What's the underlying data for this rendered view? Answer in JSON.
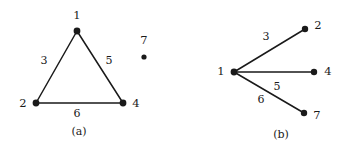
{
  "figure": {
    "background_color": "#ffffff",
    "ink_color": "#1a1a1a",
    "width": 350,
    "height": 150
  },
  "panels": [
    {
      "id": "a",
      "caption": "(a)",
      "caption_pos": {
        "x": 79,
        "y": 131
      },
      "vertices": [
        {
          "id": "v1",
          "label": "1",
          "x": 77,
          "y": 31,
          "label_x": 77,
          "label_y": 16,
          "r": 3.4
        },
        {
          "id": "v2",
          "label": "2",
          "x": 36,
          "y": 103,
          "label_x": 23,
          "label_y": 104,
          "r": 3.4
        },
        {
          "id": "v4",
          "label": "4",
          "x": 123,
          "y": 103,
          "label_x": 136,
          "label_y": 104,
          "r": 3.4
        },
        {
          "id": "v7",
          "label": "7",
          "x": 144,
          "y": 57,
          "label_x": 144,
          "label_y": 41,
          "r": 2.6
        }
      ],
      "edges": [
        {
          "id": "e3",
          "label": "3",
          "from": "v2",
          "to": "v1",
          "x1": 36,
          "y1": 103,
          "x2": 77,
          "y2": 31,
          "label_x": 44,
          "label_y": 60
        },
        {
          "id": "e5",
          "label": "5",
          "from": "v1",
          "to": "v4",
          "x1": 77,
          "y1": 31,
          "x2": 123,
          "y2": 103,
          "label_x": 109,
          "label_y": 60
        },
        {
          "id": "e6",
          "label": "6",
          "from": "v2",
          "to": "v4",
          "x1": 36,
          "y1": 103,
          "x2": 123,
          "y2": 103,
          "label_x": 77,
          "label_y": 113
        }
      ]
    },
    {
      "id": "b",
      "caption": "(b)",
      "caption_pos": {
        "x": 281,
        "y": 134
      },
      "vertices": [
        {
          "id": "v1",
          "label": "1",
          "x": 234,
          "y": 72,
          "label_x": 221,
          "label_y": 72,
          "r": 3.4
        },
        {
          "id": "v2",
          "label": "2",
          "x": 305,
          "y": 29,
          "label_x": 318,
          "label_y": 26,
          "r": 3.2
        },
        {
          "id": "v4",
          "label": "4",
          "x": 314,
          "y": 72,
          "label_x": 328,
          "label_y": 72,
          "r": 3.2
        },
        {
          "id": "v7",
          "label": "7",
          "x": 304,
          "y": 113,
          "label_x": 317,
          "label_y": 116,
          "r": 3.2
        }
      ],
      "edges": [
        {
          "id": "e3",
          "label": "3",
          "from": "v1",
          "to": "v2",
          "x1": 234,
          "y1": 72,
          "x2": 305,
          "y2": 29,
          "label_x": 266,
          "label_y": 36
        },
        {
          "id": "e5",
          "label": "5",
          "from": "v1",
          "to": "v4",
          "x1": 234,
          "y1": 72,
          "x2": 314,
          "y2": 72,
          "label_x": 277,
          "label_y": 86
        },
        {
          "id": "e6",
          "label": "6",
          "from": "v1",
          "to": "v7",
          "x1": 234,
          "y1": 72,
          "x2": 304,
          "y2": 113,
          "label_x": 261,
          "label_y": 99
        }
      ]
    }
  ]
}
